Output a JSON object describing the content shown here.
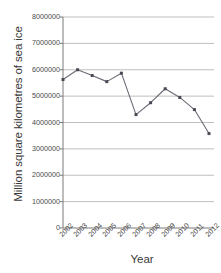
{
  "chart_data": {
    "type": "line",
    "title": "",
    "xlabel": "Year",
    "ylabel": "Million square kilometres of sea ice",
    "categories": [
      "2002",
      "2003",
      "2004",
      "2005",
      "2006",
      "2007",
      "2008",
      "2009",
      "2010",
      "2011",
      "2012"
    ],
    "values": [
      5630000,
      6000000,
      5780000,
      5550000,
      5870000,
      4300000,
      4750000,
      5280000,
      4950000,
      4490000,
      3580000
    ],
    "series": [
      {
        "name": "Sea ice extent",
        "values": [
          5630000,
          6000000,
          5780000,
          5550000,
          5870000,
          4300000,
          4750000,
          5280000,
          4950000,
          4490000,
          3580000
        ]
      }
    ],
    "ylim": [
      0,
      8000000
    ],
    "ytick_values": [
      0,
      1000000,
      2000000,
      3000000,
      4000000,
      5000000,
      6000000,
      7000000,
      8000000
    ],
    "ytick_labels": [
      "0",
      "1000000",
      "2000000",
      "3000000",
      "4000000",
      "5000000",
      "6000000",
      "7000000",
      "8000000"
    ],
    "xtick_labels": [
      "2002",
      "2003",
      "2004",
      "2005",
      "2006",
      "2007",
      "2008",
      "2009",
      "2010",
      "2011",
      "2012"
    ],
    "xtick_rotation": -45,
    "grid": "horizontal",
    "legend": "none",
    "line_color": "#6b6b78",
    "marker_color": "#4a4a55",
    "marker_shape": "square",
    "axis_color": "#7a7a7a",
    "grid_color": "#b8b8b8",
    "text_color": "#3a3a3a"
  }
}
